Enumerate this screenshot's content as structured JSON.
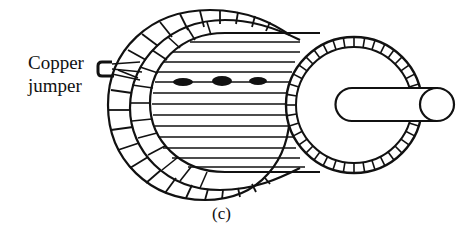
{
  "figure": {
    "type": "squirrel-cage rotor illustration",
    "labels": {
      "copper_jumper_line1": "Copper",
      "copper_jumper_line2": "jumper"
    },
    "caption": "(c)",
    "colors": {
      "ink": "#111111",
      "background": "#ffffff"
    }
  }
}
